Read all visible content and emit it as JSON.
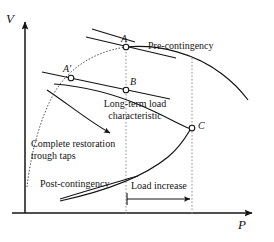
{
  "figure": {
    "type": "pv-curve-diagram",
    "title_present": false,
    "axes": {
      "y_label": "V",
      "x_label": "P",
      "origin": {
        "x": 25,
        "y": 213
      }
    },
    "curves": [
      {
        "name": "pre-contingency",
        "label": "Pre-contingency",
        "style": "dotted-then-solid",
        "description": "PV nose curve for pre-contingency system condition"
      },
      {
        "name": "post-contingency",
        "label": "Post-contingency",
        "style": "solid",
        "description": "PV nose curve after contingency, lower maximum loadability"
      },
      {
        "name": "long-term-load-characteristic-upper",
        "label": "Long-term load characteristic",
        "style": "solid-line"
      },
      {
        "name": "long-term-load-characteristic-lower",
        "label": "Long-term load characteristic",
        "style": "solid-line"
      }
    ],
    "points": [
      {
        "id": "A",
        "label": "A",
        "x": 126,
        "y": 47,
        "note": "pre-contingency operating point"
      },
      {
        "id": "Ap",
        "label": "A'",
        "x": 71,
        "y": 78,
        "note": "restored operating point"
      },
      {
        "id": "B",
        "label": "B",
        "x": 126,
        "y": 90,
        "note": "post-contingency operating point"
      },
      {
        "id": "C",
        "label": "C",
        "x": 192,
        "y": 128,
        "note": "nose / collapse point"
      }
    ],
    "annotations": [
      {
        "id": "pre-contingency",
        "text": "Pre-contingency"
      },
      {
        "id": "post-contingency",
        "text": "Post-contingency"
      },
      {
        "id": "load-characteristic",
        "line1": "Long-term load",
        "line2": "characteristic"
      },
      {
        "id": "complete-restoration",
        "line1": "Complete restoration",
        "line2": "trough taps"
      },
      {
        "id": "load-increase",
        "text": "Load increase"
      }
    ],
    "guides": [
      {
        "id": "guide-left",
        "x": 126,
        "style": "dotted",
        "from_y": 38,
        "to_y": 213
      },
      {
        "id": "guide-right",
        "x": 192,
        "style": "dotted",
        "from_y": 58,
        "to_y": 213
      }
    ],
    "colors": {
      "ink": "#141414",
      "background": "#ffffff",
      "guide": "#8a8a8a"
    }
  }
}
